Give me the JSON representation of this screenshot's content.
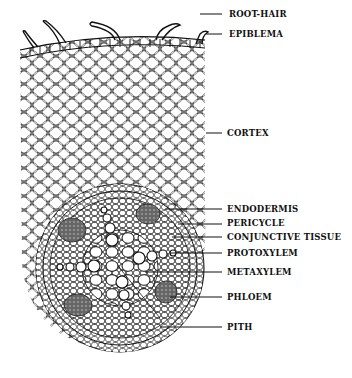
{
  "diagram": {
    "labels": [
      {
        "id": "root-hair",
        "text": "ROOT-HAIR",
        "x": 229,
        "y": 11,
        "line_y": 14
      },
      {
        "id": "epiblema",
        "text": "EPIBLEMA",
        "x": 229,
        "y": 31,
        "line_y": 34
      },
      {
        "id": "cortex",
        "text": "CORTEX",
        "x": 227,
        "y": 130,
        "line_y": 133
      },
      {
        "id": "endodermis",
        "text": "ENDODERMIS",
        "x": 227,
        "y": 205,
        "line_y": 209
      },
      {
        "id": "pericycle",
        "text": "PERICYCLE",
        "x": 227,
        "y": 220,
        "line_y": 224
      },
      {
        "id": "conjunctive-tissue",
        "text": "CONJUNCTIVE TISSUE",
        "x": 227,
        "y": 233,
        "line_y": 237
      },
      {
        "id": "protoxylem",
        "text": "PROTOXYLEM",
        "x": 227,
        "y": 249,
        "line_y": 253
      },
      {
        "id": "metaxylem",
        "text": "METAXYLEM",
        "x": 227,
        "y": 268,
        "line_y": 272
      },
      {
        "id": "phloem",
        "text": "PHLOEM",
        "x": 227,
        "y": 293,
        "line_y": 297
      },
      {
        "id": "pith",
        "text": "PITH",
        "x": 227,
        "y": 323,
        "line_y": 327
      }
    ],
    "colors": {
      "ink": "#111111",
      "phloem_fill": "#555555",
      "background": "#ffffff"
    }
  }
}
